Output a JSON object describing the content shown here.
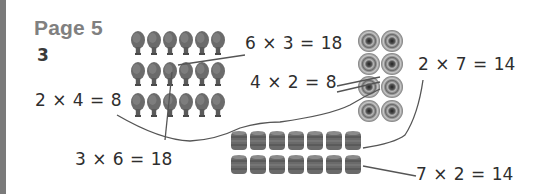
{
  "page": {
    "title": "Page 5",
    "question_number": "3"
  },
  "equations": {
    "eq_6x3": "6 × 3 = 18",
    "eq_4x2": "4 × 2 = 8",
    "eq_2x4": "2 × 4 = 8",
    "eq_3x6": "3 × 6 = 18",
    "eq_2x7": "2 × 7 = 14",
    "eq_7x2": "7 × 2 = 14"
  },
  "arrays": [
    {
      "name": "rackets",
      "icon": "table-tennis-bat",
      "rows": 3,
      "cols": 6
    },
    {
      "name": "targets",
      "icon": "target",
      "rows": 4,
      "cols": 2
    },
    {
      "name": "barrels",
      "icon": "barrel",
      "rows": 2,
      "cols": 7
    }
  ],
  "colors": {
    "bar": "#7a7a7a",
    "title": "#808080",
    "text": "#2e2e2e",
    "line": "#555555"
  }
}
